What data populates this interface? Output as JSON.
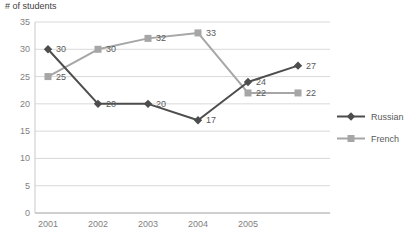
{
  "chart_data": {
    "type": "line",
    "title": "# of students",
    "categories": [
      "2001",
      "2002",
      "2003",
      "2004",
      "2005",
      ""
    ],
    "series": [
      {
        "name": "Russian",
        "values": [
          30,
          20,
          20,
          17,
          24,
          27
        ],
        "color": "#4d4d4d",
        "marker": "diamond"
      },
      {
        "name": "French",
        "values": [
          25,
          30,
          32,
          33,
          22,
          22
        ],
        "color": "#a6a6a6",
        "marker": "square"
      }
    ],
    "ylim": [
      0,
      35
    ],
    "ytick_step": 5,
    "grid": true,
    "data_labels": true,
    "legend_position": "right",
    "colors": {
      "gridline": "#d9d9d9",
      "axis_line": "#9e9e9e",
      "y_axis_line": "#c9c9c9",
      "tick_text": "#7f7f7f",
      "data_label_text": "#595959",
      "legend_text": "#595959"
    }
  }
}
